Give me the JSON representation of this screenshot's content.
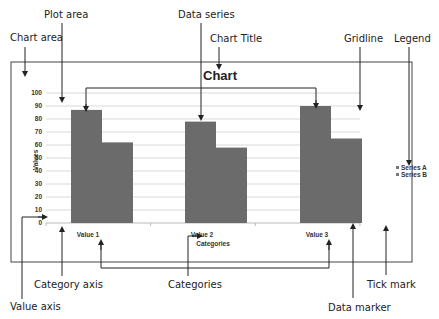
{
  "chart_data": {
    "type": "bar",
    "title": "Chart",
    "xlabel": "Categories",
    "ylabel": "Values",
    "categories": [
      "Value 1",
      "Value 2",
      "Value 3"
    ],
    "series": [
      {
        "name": "Series A",
        "values": [
          87,
          78,
          90
        ]
      },
      {
        "name": "Series B",
        "values": [
          62,
          58,
          65
        ]
      }
    ],
    "ylim": [
      0,
      100
    ],
    "yticks": [
      0,
      10,
      20,
      30,
      40,
      50,
      60,
      70,
      80,
      90,
      100
    ],
    "grid": true,
    "legend": "right",
    "colors": {
      "series_a": "#6b6b6b",
      "series_b": "#6b6b6b",
      "gridline": "#d9d9d9",
      "frame": "#444444"
    }
  },
  "callouts": {
    "chart_area": "Chart area",
    "plot_area": "Plot area",
    "data_series": "Data series",
    "chart_title": "Chart Title",
    "gridline": "Gridline",
    "legend": "Legend",
    "category_axis": "Category axis",
    "categories": "Categories",
    "value_axis": "Value axis",
    "tick_mark": "Tick mark",
    "data_marker": "Data marker"
  }
}
